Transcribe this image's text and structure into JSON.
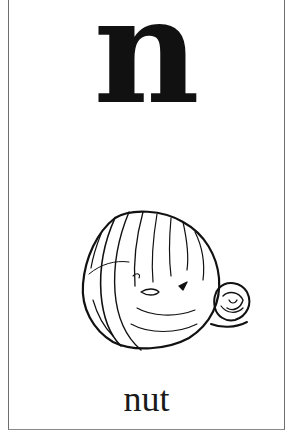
{
  "card": {
    "letter": "n",
    "word": "nut",
    "illustration": "nut-drawing"
  },
  "colors": {
    "background": "#ffffff",
    "ink": "#111111",
    "border": "#6e6e6e"
  }
}
